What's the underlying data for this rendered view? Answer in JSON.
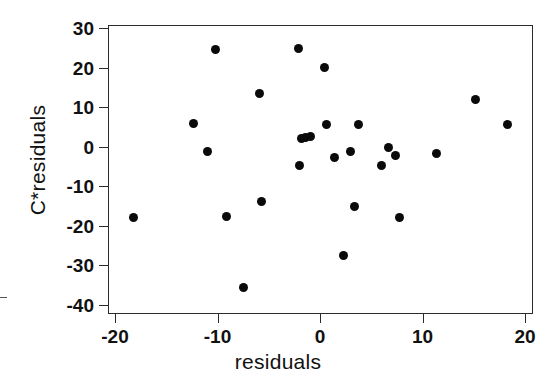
{
  "chart_data": {
    "type": "scatter",
    "title": "",
    "xlabel": "residuals",
    "ylabel": "C*residuals",
    "xlim": [
      -21,
      21
    ],
    "ylim": [
      -41,
      31
    ],
    "xticks": [
      -20,
      -10,
      0,
      10,
      20
    ],
    "yticks": [
      30,
      20,
      10,
      0,
      -10,
      -20,
      -30,
      -40
    ],
    "xtick_labels": [
      "-20",
      "-10",
      "0",
      "10",
      "20"
    ],
    "ytick_labels": [
      "30",
      "20",
      "10",
      "0",
      "-10",
      "-20",
      "-30",
      "-40"
    ],
    "grid": false,
    "legend": false,
    "marker": "filled-circle",
    "marker_color": "#0a0a0a",
    "frame_color": "#2b2b2b",
    "n_points": 29,
    "points": [
      {
        "x": -18.2,
        "y": -18.0
      },
      {
        "x": -12.3,
        "y": 5.9
      },
      {
        "x": -11.0,
        "y": -1.3
      },
      {
        "x": -10.2,
        "y": 24.5
      },
      {
        "x": -9.1,
        "y": -17.6
      },
      {
        "x": -7.5,
        "y": -35.5
      },
      {
        "x": -5.9,
        "y": 13.5
      },
      {
        "x": -5.7,
        "y": -13.8
      },
      {
        "x": -2.1,
        "y": 24.9
      },
      {
        "x": -2.0,
        "y": -4.7
      },
      {
        "x": -1.8,
        "y": 2.2
      },
      {
        "x": -1.4,
        "y": 2.3
      },
      {
        "x": -0.9,
        "y": 2.7
      },
      {
        "x": 0.4,
        "y": 20.1
      },
      {
        "x": 0.6,
        "y": 5.7
      },
      {
        "x": 1.4,
        "y": -2.6
      },
      {
        "x": 2.3,
        "y": -27.5
      },
      {
        "x": 3.0,
        "y": -1.1
      },
      {
        "x": 3.4,
        "y": -15.1
      },
      {
        "x": 3.8,
        "y": 5.6
      },
      {
        "x": 6.0,
        "y": -4.7
      },
      {
        "x": 6.7,
        "y": -0.2
      },
      {
        "x": 7.4,
        "y": -2.1
      },
      {
        "x": 7.8,
        "y": -17.8
      },
      {
        "x": 11.4,
        "y": -1.8
      },
      {
        "x": 15.2,
        "y": 12.0
      },
      {
        "x": 18.3,
        "y": 5.6
      }
    ]
  },
  "axes": {
    "x_title": "residuals",
    "y_title": "C*residuals"
  }
}
